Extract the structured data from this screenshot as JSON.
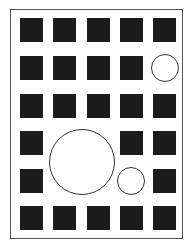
{
  "figure": {
    "grid": {
      "columns": 5,
      "rows": 6
    },
    "colors": {
      "square": "#1c1c1c",
      "circle_stroke": "#333333",
      "frame": "#555555",
      "background": "#ffffff"
    },
    "squares": [
      {
        "row": 0,
        "col": 0
      },
      {
        "row": 0,
        "col": 1
      },
      {
        "row": 0,
        "col": 2
      },
      {
        "row": 0,
        "col": 3
      },
      {
        "row": 0,
        "col": 4
      },
      {
        "row": 1,
        "col": 0
      },
      {
        "row": 1,
        "col": 1
      },
      {
        "row": 1,
        "col": 2
      },
      {
        "row": 1,
        "col": 3
      },
      {
        "row": 2,
        "col": 0
      },
      {
        "row": 2,
        "col": 1
      },
      {
        "row": 2,
        "col": 2
      },
      {
        "row": 2,
        "col": 3
      },
      {
        "row": 2,
        "col": 4
      },
      {
        "row": 3,
        "col": 0
      },
      {
        "row": 3,
        "col": 3
      },
      {
        "row": 3,
        "col": 4
      },
      {
        "row": 4,
        "col": 0
      },
      {
        "row": 4,
        "col": 4
      },
      {
        "row": 5,
        "col": 0
      },
      {
        "row": 5,
        "col": 1
      },
      {
        "row": 5,
        "col": 2
      },
      {
        "row": 5,
        "col": 3
      },
      {
        "row": 5,
        "col": 4
      }
    ],
    "circles": [
      {
        "name": "small-circle",
        "cx": 165,
        "cy": 68,
        "r": 14
      },
      {
        "name": "large-circle",
        "cx": 82,
        "cy": 162,
        "r": 33
      },
      {
        "name": "medium-circle",
        "cx": 131,
        "cy": 181,
        "r": 14
      }
    ]
  }
}
